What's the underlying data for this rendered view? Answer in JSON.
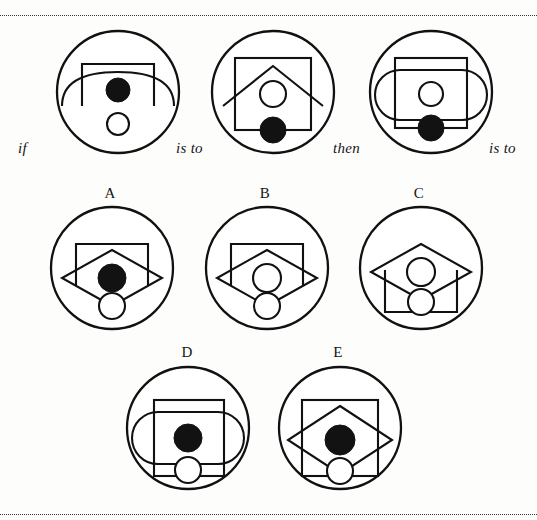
{
  "page": {
    "background": "#fdfdfc",
    "ink": "#111111",
    "rule_top_y": 15,
    "rule_bottom_y": 514,
    "type": "visual-analogy-puzzle"
  },
  "prompt": {
    "connectors": [
      {
        "id": "if",
        "label": "if"
      },
      {
        "id": "is-to-1",
        "label": "is to"
      },
      {
        "id": "then",
        "label": "then"
      },
      {
        "id": "is-to-2",
        "label": "is to"
      }
    ],
    "figures": [
      {
        "id": "q1",
        "position": 1,
        "elements": [
          "outer-circle",
          "goal-rectangle-open-bottom",
          "wide-shallow-arc",
          "filled-circle-center",
          "open-circle-lower"
        ]
      },
      {
        "id": "q2",
        "position": 2,
        "elements": [
          "outer-circle",
          "square",
          "roof-chevron",
          "open-circle-center",
          "filled-circle-lower"
        ]
      },
      {
        "id": "q3",
        "position": 3,
        "elements": [
          "outer-circle",
          "rectangle",
          "pill-stadium",
          "open-circle-center",
          "filled-circle-lower"
        ]
      }
    ]
  },
  "options": [
    {
      "id": "a",
      "label": "A",
      "elements": [
        "outer-circle",
        "goal-rectangle-open-bottom",
        "diamond",
        "filled-circle-center",
        "open-circle-lower"
      ]
    },
    {
      "id": "b",
      "label": "B",
      "elements": [
        "outer-circle",
        "goal-rectangle-open-bottom",
        "diamond",
        "open-circle-center",
        "open-circle-lower"
      ]
    },
    {
      "id": "c",
      "label": "C",
      "elements": [
        "outer-circle",
        "goal-rectangle-open-top",
        "diamond",
        "open-circle-center",
        "open-circle-lower"
      ]
    },
    {
      "id": "d",
      "label": "D",
      "elements": [
        "outer-circle",
        "rectangle",
        "pill-stadium",
        "filled-circle-center",
        "open-circle-lower"
      ]
    },
    {
      "id": "e",
      "label": "E",
      "elements": [
        "outer-circle",
        "square",
        "diamond",
        "filled-circle-center",
        "open-circle-lower"
      ]
    }
  ]
}
